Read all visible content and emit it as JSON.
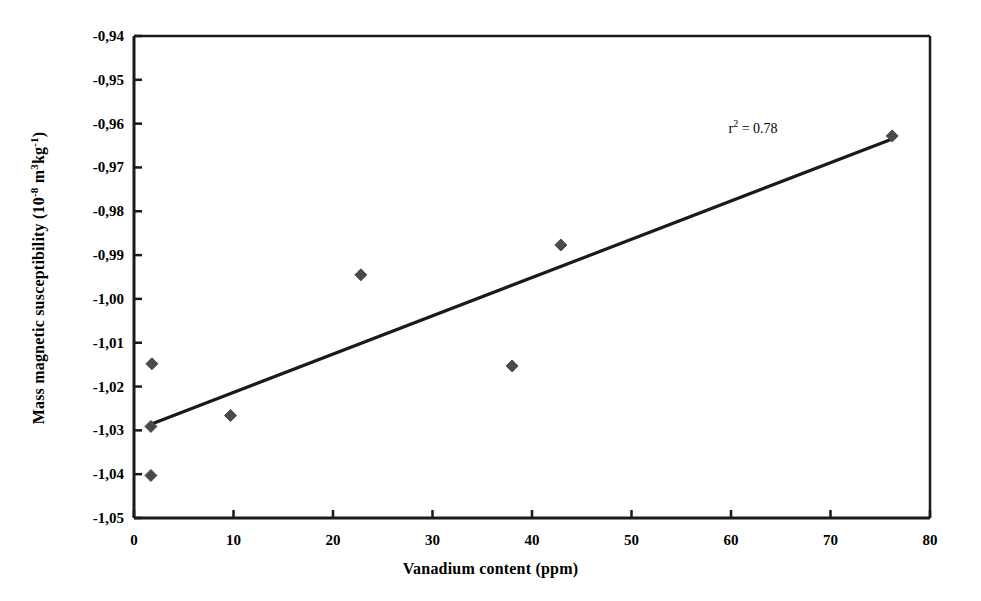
{
  "chart_data": {
    "type": "scatter",
    "title": "",
    "xlabel": "Vanadium content (ppm)",
    "ylabel": "Mass magnetic susceptibility (10 -8 m3kg-1)",
    "ylabel_parts": {
      "prefix": "Mass magnetic susceptibility (10",
      "exponent1": "-8",
      "middle": " m",
      "exponent2": "3",
      "unit": "kg",
      "exponent3": "-1",
      "suffix": ")"
    },
    "xlim": [
      0,
      80
    ],
    "ylim": [
      -1.05,
      -0.94
    ],
    "xticks": [
      0,
      10,
      20,
      30,
      40,
      50,
      60,
      70,
      80
    ],
    "yticks": [
      -0.94,
      -0.95,
      -0.96,
      -0.97,
      -0.98,
      -0.99,
      -1.0,
      -1.01,
      -1.02,
      -1.03,
      -1.04,
      -1.05
    ],
    "xtick_labels": [
      "0",
      "10",
      "20",
      "30",
      "40",
      "50",
      "60",
      "70",
      "80"
    ],
    "ytick_labels": [
      "-0,94",
      "-0,95",
      "-0,96",
      "-0,97",
      "-0,98",
      "-0,99",
      "-1,00",
      "-1,01",
      "-1,02",
      "-1,03",
      "-1,04",
      "-1,05"
    ],
    "decimal_separator_axis": ",",
    "grid": false,
    "legend": false,
    "marker": "diamond",
    "marker_color": "#4a4a4a",
    "line_color": "#1a1a1a",
    "axis_color": "#1a1a1a",
    "points": [
      {
        "x": 1.8,
        "y": -1.0148
      },
      {
        "x": 1.7,
        "y": -1.0291
      },
      {
        "x": 1.7,
        "y": -1.0403
      },
      {
        "x": 9.7,
        "y": -1.0266
      },
      {
        "x": 22.8,
        "y": -0.9945
      },
      {
        "x": 38.0,
        "y": -1.0153
      },
      {
        "x": 42.9,
        "y": -0.9877
      },
      {
        "x": 76.2,
        "y": -0.9628
      }
    ],
    "trendline": {
      "x0": 1.7,
      "y0": -1.0286,
      "x1": 76.2,
      "y1": -0.9635
    },
    "annotations": [
      {
        "text": "r2 = 0.78",
        "label": "r",
        "exponent": "2",
        "rest": " = 0.78",
        "x": 62.2,
        "y": -0.9612
      }
    ]
  }
}
